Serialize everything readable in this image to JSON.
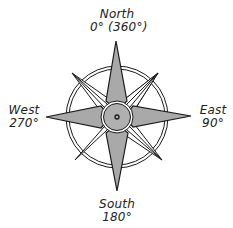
{
  "diagram": {
    "type": "compass-rose",
    "colors": {
      "fill_gray": "#a9a9a9",
      "fill_white": "#ffffff",
      "stroke": "#1a1a1a",
      "hub_gray": "#b0b0b0"
    },
    "labels": {
      "north": {
        "direction": "North",
        "degrees": "0° (360°)"
      },
      "east": {
        "direction": "East",
        "degrees": "90°"
      },
      "south": {
        "direction": "South",
        "degrees": "180°"
      },
      "west": {
        "direction": "West",
        "degrees": "270°"
      }
    },
    "points": {
      "cardinal": [
        "N",
        "E",
        "S",
        "W"
      ],
      "intercardinal": [
        "NE",
        "SE",
        "SW",
        "NW"
      ]
    }
  }
}
